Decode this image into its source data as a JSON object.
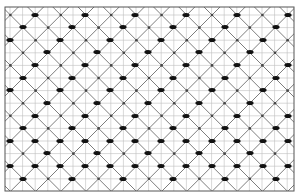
{
  "diagram": {
    "type": "knitting-lattice-pattern",
    "canvas": {
      "width": 300,
      "height": 196,
      "background": "#ffffff"
    },
    "frame": {
      "x": 5,
      "y": 7,
      "width": 289,
      "height": 184,
      "stroke": "#555555",
      "stroke_width": 1
    },
    "grid": {
      "color": "#bdbdbd",
      "stroke_width": 0.6,
      "x_start": 10,
      "x_step": 12.6,
      "y_start": 15,
      "y_step": 12.6
    },
    "diagonals": {
      "color": "#6e6e6e",
      "stroke_width": 0.9,
      "pitch": 50.4,
      "anchor_x": 23,
      "anchor_y": 2.4
    },
    "nodes": {
      "color": "#444444",
      "radius": 1.3
    },
    "dots": {
      "color": "#111111",
      "rx": 3.6,
      "ry": 2.1,
      "rows": [
        {
          "y": 15,
          "xs": [
            35,
            85,
            135,
            186,
            237,
            288
          ]
        },
        {
          "y": 27,
          "xs": [
            23,
            72,
            123,
            173,
            225,
            276
          ]
        },
        {
          "y": 40,
          "xs": [
            10,
            60,
            110,
            161,
            212,
            263
          ]
        },
        {
          "y": 52,
          "xs": [
            47,
            97,
            148,
            199,
            250
          ]
        },
        {
          "y": 65,
          "xs": [
            35,
            85,
            135,
            186,
            237,
            288
          ]
        },
        {
          "y": 78,
          "xs": [
            23,
            72,
            123,
            173,
            225,
            276
          ]
        },
        {
          "y": 90,
          "xs": [
            10,
            60,
            110,
            161,
            212,
            263
          ]
        },
        {
          "y": 103,
          "xs": [
            47,
            97,
            148,
            199,
            250
          ]
        },
        {
          "y": 116,
          "xs": [
            35,
            85,
            135,
            186,
            237,
            288
          ]
        },
        {
          "y": 128,
          "xs": [
            23,
            72,
            123,
            173,
            225,
            276
          ]
        },
        {
          "y": 141,
          "xs": [
            10,
            35,
            60,
            85,
            110,
            135,
            161,
            186,
            212,
            237,
            263,
            288
          ]
        },
        {
          "y": 153,
          "xs": [
            47,
            97,
            148,
            199,
            250
          ]
        },
        {
          "y": 166,
          "xs": [
            10,
            35,
            60,
            85,
            110,
            135,
            161,
            186,
            212,
            237,
            263,
            288
          ]
        },
        {
          "y": 179,
          "xs": [
            23,
            72,
            123,
            173,
            225,
            276
          ]
        }
      ]
    }
  }
}
